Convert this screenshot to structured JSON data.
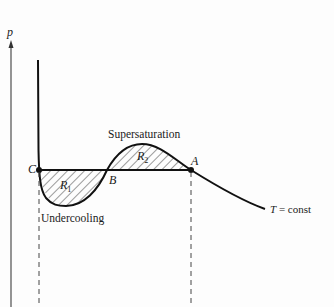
{
  "diagram": {
    "axis_label": "p",
    "points": {
      "A": "A",
      "B": "B",
      "C": "C"
    },
    "regions": {
      "R1": "R",
      "R1_sub": "1",
      "R2": "R",
      "R2_sub": "2"
    },
    "annotations": {
      "supersaturation": "Supersaturation",
      "undercooling": "Undercooling",
      "isotherm_T": "T",
      "isotherm_rest": " = const"
    },
    "colors": {
      "line": "#111111",
      "axis": "#555555",
      "dashed": "#444444"
    }
  }
}
